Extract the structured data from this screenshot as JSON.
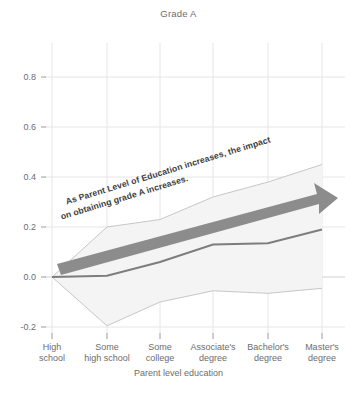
{
  "chart_data": {
    "type": "line",
    "title": "Grade A",
    "xlabel": "Parent level education",
    "ylabel": "",
    "categories": [
      "High\nschool",
      "Some\nhigh school",
      "Some\ncollege",
      "Associate's\ndegree",
      "Bachelor's\ndegree",
      "Master's\ndegree"
    ],
    "ylim": [
      -0.26,
      0.88
    ],
    "yticks": [
      0.8,
      0.6,
      0.4,
      0.2,
      0.0,
      -0.2
    ],
    "ytick_labels": [
      "0.8",
      "0.6",
      "0.4",
      "0.2",
      "0.0",
      "-0.2"
    ],
    "grid": true,
    "legend": "none",
    "series": [
      {
        "name": "estimate",
        "values": [
          0.0,
          0.005,
          0.06,
          0.13,
          0.135,
          0.19
        ]
      },
      {
        "name": "ci_upper",
        "values": [
          0.0,
          0.2,
          0.23,
          0.32,
          0.38,
          0.45
        ]
      },
      {
        "name": "ci_lower",
        "values": [
          0.0,
          -0.195,
          -0.1,
          -0.055,
          -0.065,
          -0.045
        ]
      }
    ],
    "annotations": [
      {
        "text_line1": "As Parent Level of Education increases, the impact",
        "text_line2": "on obtaining grade A increases.",
        "rotation_deg": -17
      }
    ],
    "arrow": {
      "label": "trend-arrow",
      "from": [
        0.25,
        0.055
      ],
      "to": [
        5.25,
        0.27
      ]
    }
  },
  "colors": {
    "line": "#7a7a7a",
    "band_fill": "#f2f2f2",
    "band_edge": "#c9c9c9",
    "grid": "#e3e3e3",
    "arrow": "#8c8c8c",
    "text": "#6d6d6d",
    "annotation_text": "#3d3d3d",
    "background": "#ffffff"
  },
  "ytick_positions_px": {
    "0.8": 77,
    "0.6": 127,
    "0.4": 177,
    "0.2": 227,
    "0.0": 277,
    "-0.2": 327
  },
  "xtick_positions_px": [
    52,
    107,
    160,
    213,
    268,
    322
  ]
}
